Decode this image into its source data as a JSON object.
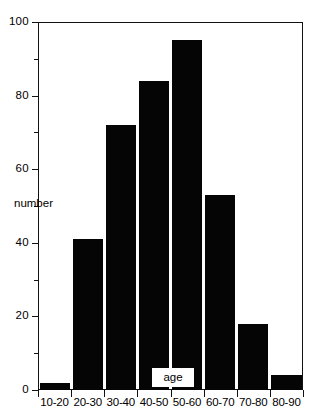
{
  "chart_data": {
    "type": "bar",
    "title": "",
    "subtitle": "",
    "xlabel": "age",
    "ylabel": "number",
    "categories": [
      "10-20",
      "20-30",
      "30-40",
      "40-50",
      "50-60",
      "60-70",
      "70-80",
      "80-90"
    ],
    "values": [
      2,
      41,
      72,
      84,
      95,
      53,
      18,
      4
    ],
    "series": [
      {
        "name": "number",
        "values": [
          2,
          41,
          72,
          84,
          95,
          53,
          18,
          4
        ]
      }
    ],
    "ylim": [
      0,
      100
    ],
    "y_major_ticks": [
      0,
      20,
      40,
      60,
      80,
      100
    ],
    "y_minor_ticks": [
      10,
      30,
      50,
      70,
      90
    ],
    "y_tick_labels": [
      "0",
      "20",
      "40",
      "60",
      "80",
      "100"
    ],
    "grid": false,
    "legend": false,
    "legend_position": "none",
    "bar_color": "#050505",
    "axis_color": "#111111",
    "background_color": "#ffffff",
    "annotations": [
      {
        "text": "number",
        "role": "y-axis-title"
      },
      {
        "text": "age",
        "role": "x-axis-title"
      }
    ]
  }
}
